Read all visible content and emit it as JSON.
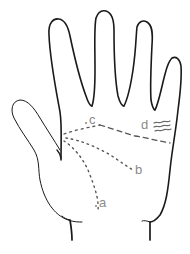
{
  "figure": {
    "type": "palm-lines-diagram",
    "colors": {
      "outline": "#1a1a1a",
      "lines": "#555555",
      "labels": "#8a8a8a",
      "background": "#ffffff"
    },
    "labels": [
      {
        "id": "a",
        "text": "a"
      },
      {
        "id": "b",
        "text": "b"
      },
      {
        "id": "c",
        "text": "c"
      },
      {
        "id": "d",
        "text": "d"
      }
    ]
  }
}
